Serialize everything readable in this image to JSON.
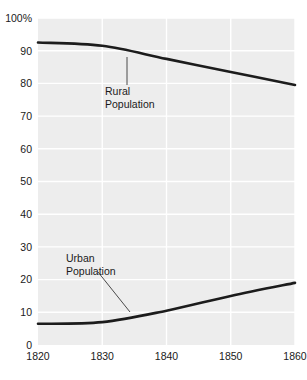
{
  "chart_data": {
    "type": "line",
    "title": "",
    "subtitle": "",
    "xlabel": "",
    "ylabel": "",
    "xlim": [
      1820,
      1860
    ],
    "ylim": [
      0,
      100
    ],
    "grid": true,
    "legend_position": "inline-annotations",
    "x": [
      1820,
      1830,
      1840,
      1850,
      1860
    ],
    "xticklabels": [
      "1820",
      "1830",
      "1840",
      "1850",
      "1860"
    ],
    "yticks": [
      0,
      10,
      20,
      30,
      40,
      50,
      60,
      70,
      80,
      90,
      100
    ],
    "yticklabels": [
      "0",
      "10",
      "20",
      "30",
      "40",
      "50",
      "60",
      "70",
      "80",
      "90",
      "100%"
    ],
    "series": [
      {
        "name": "Rural Population",
        "values": [
          92.5,
          91.5,
          87.5,
          83.5,
          79.5
        ],
        "color": "#1c1c1c"
      },
      {
        "name": "Urban Population",
        "values": [
          6.5,
          7.0,
          10.5,
          15.0,
          19.0
        ],
        "color": "#1c1c1c"
      }
    ],
    "annotations": [
      {
        "id": "rural",
        "line1": "Rural",
        "line2": "Population",
        "text_x": 105,
        "text_y": 95,
        "leader": {
          "x1": 127,
          "y1": 85,
          "x2": 127,
          "y2": 57
        }
      },
      {
        "id": "urban",
        "line1": "Urban",
        "line2": "Population",
        "text_x": 66,
        "text_y": 262,
        "leader": {
          "x1": 98,
          "y1": 272,
          "x2": 130,
          "y2": 312
        }
      }
    ],
    "colors": {
      "plot_background": "#ededed",
      "gridline": "#ffffff",
      "line": "#1c1c1c",
      "text": "#1a1a1a",
      "page_background": "#ffffff"
    }
  }
}
